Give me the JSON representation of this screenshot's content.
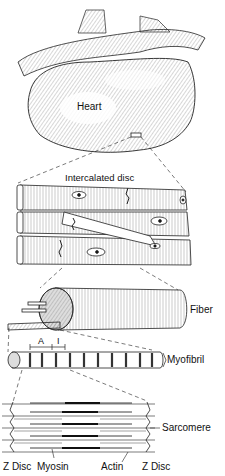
{
  "diagram": {
    "type": "anatomical-hierarchy",
    "levels": [
      {
        "id": "heart",
        "label": "Heart"
      },
      {
        "id": "cells",
        "label": "Intercalated disc"
      },
      {
        "id": "fiber",
        "label": "Fiber"
      },
      {
        "id": "myofibril",
        "label": "Myofibril",
        "bands": [
          "A",
          "I"
        ]
      },
      {
        "id": "sarcomere",
        "label": "Sarcomere"
      }
    ],
    "labels": {
      "heart": "Heart",
      "intercalated_disc": "Intercalated disc",
      "fiber": "Fiber",
      "band_a": "A",
      "band_i": "I",
      "myofibril": "Myofibril",
      "sarcomere": "Sarcomere",
      "z_disc_left": "Z Disc",
      "myosin": "Myosin",
      "actin": "Actin",
      "z_disc_right": "Z Disc"
    },
    "colors": {
      "ink": "#111111",
      "background": "#ffffff"
    }
  }
}
